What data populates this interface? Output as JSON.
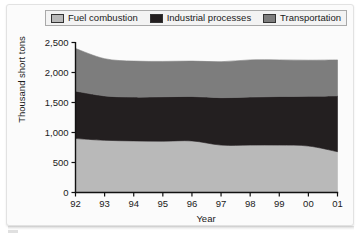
{
  "legend": {
    "items": [
      {
        "label": "Fuel combustion",
        "color": "#b9b9b9",
        "icon": "legend-swatch-icon"
      },
      {
        "label": "Industrial processes",
        "color": "#231f20",
        "icon": "legend-swatch-icon"
      },
      {
        "label": "Transportation",
        "color": "#7d7d7d",
        "icon": "legend-swatch-icon"
      }
    ]
  },
  "axes": {
    "ylabel": "Thousand short tons",
    "xlabel": "Year",
    "ytick_labels": [
      "2,500",
      "2,000",
      "1,500",
      "1,000",
      "500",
      "0"
    ],
    "xtick_labels": [
      "92",
      "93",
      "94",
      "95",
      "96",
      "97",
      "98",
      "99",
      "00",
      "01"
    ]
  },
  "chart_data": {
    "type": "area",
    "title": "",
    "subtitle": "",
    "xlabel": "Year",
    "ylabel": "Thousand short tons",
    "categories": [
      "92",
      "93",
      "94",
      "95",
      "96",
      "97",
      "98",
      "99",
      "00",
      "01"
    ],
    "x": [
      "92",
      "93",
      "94",
      "95",
      "96",
      "97",
      "98",
      "99",
      "00",
      "01"
    ],
    "stacked": true,
    "series": [
      {
        "name": "Fuel combustion",
        "color": "#b9b9b9",
        "values": [
          900,
          870,
          860,
          855,
          860,
          790,
          790,
          790,
          775,
          680
        ]
      },
      {
        "name": "Industrial processes",
        "color": "#231f20",
        "values": [
          790,
          740,
          730,
          740,
          740,
          790,
          800,
          810,
          830,
          930
        ]
      },
      {
        "name": "Transportation",
        "color": "#7d7d7d",
        "values": [
          710,
          620,
          600,
          590,
          590,
          600,
          620,
          610,
          600,
          600
        ]
      }
    ],
    "totals": [
      2400,
      2230,
      2190,
      2185,
      2190,
      2180,
      2210,
      2210,
      2205,
      2210
    ],
    "ylim": [
      0,
      2500
    ],
    "ytick_values": [
      0,
      500,
      1000,
      1500,
      2000,
      2500
    ],
    "grid": false,
    "legend_position": "top"
  }
}
